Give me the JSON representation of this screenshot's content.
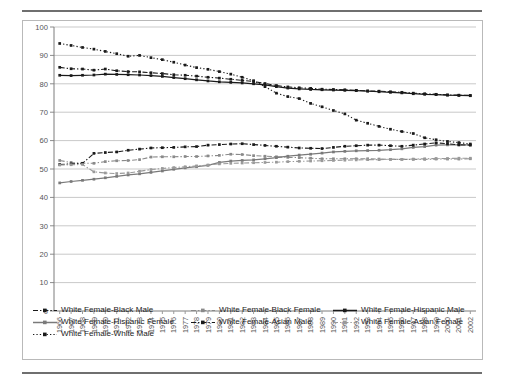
{
  "chart_data": {
    "type": "line",
    "title": "",
    "subtitle": "",
    "xlabel": "",
    "ylabel": "",
    "ylim": [
      0,
      100
    ],
    "ytick_step": 10,
    "yticks": [
      0,
      10,
      20,
      30,
      40,
      50,
      60,
      70,
      80,
      90,
      100
    ],
    "grid": true,
    "grid_axis": "y",
    "legend_position": "bottom",
    "categories": [
      "1966",
      "1967",
      "1968",
      "1969",
      "1970",
      "1971",
      "1972",
      "1973",
      "1974",
      "1975",
      "1976",
      "1977",
      "1978",
      "1979",
      "1980",
      "1981",
      "1982",
      "1983",
      "1984",
      "1985",
      "1986",
      "1987",
      "1988",
      "1989",
      "1990",
      "1991",
      "1992",
      "1993",
      "1994",
      "1995",
      "1996",
      "1997",
      "1998",
      "1999",
      "2000",
      "2001",
      "2002"
    ],
    "series": [
      {
        "name": "White Female-Black Male",
        "color": "#1a1a1a",
        "line_style": "dash-dot",
        "marker": "square",
        "values": [
          85.8,
          85.3,
          85.2,
          84.8,
          85.2,
          84.6,
          84.3,
          84.2,
          83.9,
          83.6,
          83.2,
          83.0,
          82.7,
          82.3,
          82.0,
          81.6,
          81.2,
          80.8,
          80.1,
          79.4,
          78.9,
          78.6,
          78.4,
          78.1,
          78.0,
          77.9,
          77.7,
          77.5,
          77.4,
          77.2,
          77.0,
          76.7,
          76.5,
          76.3,
          76.1,
          76.0,
          75.9
        ]
      },
      {
        "name": "White Female-Black Female",
        "color": "#8a8a8a",
        "line_style": "dash-dot",
        "marker": "square",
        "values": [
          53.0,
          52.3,
          52.0,
          52.0,
          52.6,
          52.9,
          53.0,
          53.3,
          54.2,
          54.3,
          54.3,
          54.4,
          54.4,
          54.6,
          54.8,
          55.2,
          55.1,
          54.7,
          54.5,
          54.3,
          54.1,
          54.0,
          53.8,
          53.6,
          53.6,
          53.6,
          53.6,
          53.6,
          53.5,
          53.4,
          53.4,
          53.4,
          53.4,
          53.5,
          53.5,
          53.5,
          53.6
        ]
      },
      {
        "name": "White Female-Hispanic Male",
        "color": "#1a1a1a",
        "line_style": "solid",
        "marker": "square",
        "values": [
          83.0,
          82.9,
          83.0,
          83.1,
          83.4,
          83.3,
          83.2,
          83.1,
          82.9,
          82.6,
          82.2,
          81.8,
          81.4,
          81.0,
          80.7,
          80.5,
          80.3,
          80.0,
          79.6,
          79.0,
          78.5,
          78.2,
          78.0,
          77.9,
          77.8,
          77.7,
          77.6,
          77.4,
          77.2,
          77.0,
          76.8,
          76.5,
          76.3,
          76.2,
          76.0,
          75.9,
          75.8
        ]
      },
      {
        "name": "White Female-Hispanic Female",
        "color": "#7a7a7a",
        "line_style": "solid",
        "marker": "square",
        "values": [
          45.1,
          45.6,
          46.0,
          46.4,
          46.9,
          47.4,
          47.9,
          48.3,
          48.8,
          49.3,
          49.9,
          50.4,
          50.8,
          51.3,
          52.3,
          52.8,
          53.0,
          53.2,
          53.6,
          54.0,
          54.5,
          54.9,
          55.2,
          55.6,
          56.0,
          56.2,
          56.4,
          56.5,
          56.6,
          56.8,
          57.1,
          57.6,
          57.9,
          58.4,
          58.5,
          58.5,
          58.5
        ]
      },
      {
        "name": "White Female-Asian Male",
        "color": "#1a1a1a",
        "line_style": "dash-dot",
        "marker": "square",
        "values": [
          51.6,
          51.8,
          52.0,
          55.5,
          55.8,
          56.0,
          56.6,
          57.0,
          57.4,
          57.5,
          57.6,
          57.8,
          57.9,
          58.4,
          58.6,
          58.8,
          58.9,
          58.6,
          58.3,
          58.0,
          57.7,
          57.4,
          57.3,
          57.2,
          57.6,
          58.0,
          58.2,
          58.4,
          58.4,
          58.2,
          58.0,
          58.4,
          58.8,
          59.2,
          58.9,
          58.5,
          58.4
        ]
      },
      {
        "name": "White Female-Asian Female",
        "color": "#9a9a9a",
        "line_style": "dash-dot",
        "marker": "square",
        "values": [
          51.4,
          51.5,
          51.6,
          49.0,
          48.6,
          48.4,
          48.6,
          49.2,
          49.8,
          50.2,
          50.5,
          50.8,
          51.1,
          51.4,
          51.8,
          52.0,
          52.1,
          52.2,
          52.3,
          52.4,
          52.6,
          52.7,
          52.8,
          52.9,
          53.0,
          53.1,
          53.2,
          53.3,
          53.3,
          53.4,
          53.4,
          53.5,
          53.6,
          53.7,
          53.7,
          53.8,
          53.8
        ]
      },
      {
        "name": "White Female-White Male",
        "color": "#1a1a1a",
        "line_style": "dotted",
        "marker": "square",
        "values": [
          94.2,
          93.5,
          92.8,
          92.2,
          91.4,
          90.6,
          89.7,
          90.0,
          89.2,
          88.5,
          87.6,
          86.6,
          85.7,
          85.1,
          84.3,
          83.4,
          82.3,
          81.1,
          79.0,
          76.7,
          75.5,
          74.8,
          73.1,
          71.9,
          70.6,
          69.4,
          67.2,
          66.1,
          65.0,
          64.0,
          63.2,
          62.5,
          61.0,
          60.3,
          59.7,
          59.3,
          58.8
        ]
      }
    ]
  },
  "legend": {
    "entries": [
      {
        "label": "White Female-Black Male",
        "style": "dash-dot",
        "color": "#1a1a1a"
      },
      {
        "label": "White Female-Black Female",
        "style": "dash-dot",
        "color": "#8a8a8a"
      },
      {
        "label": "White Female-Hispanic Male",
        "style": "solid",
        "color": "#1a1a1a"
      },
      {
        "label": "White Female-Hispanic Female",
        "style": "solid",
        "color": "#7a7a7a"
      },
      {
        "label": "White Female-Asian Male",
        "style": "dash-dot",
        "color": "#1a1a1a"
      },
      {
        "label": "White Female-Asian Female",
        "style": "dash-dot",
        "color": "#9a9a9a"
      },
      {
        "label": "White Female-White Male",
        "style": "dotted",
        "color": "#1a1a1a"
      }
    ]
  },
  "axes": {
    "y_min_label": "0",
    "y_max_label": "100"
  }
}
